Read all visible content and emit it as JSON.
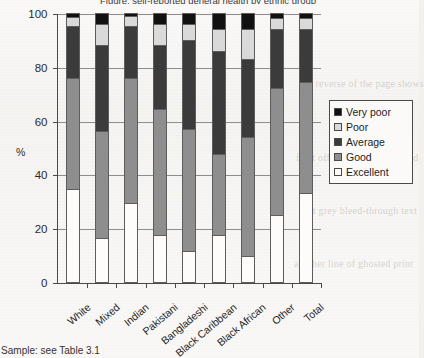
{
  "chart_data": {
    "type": "bar",
    "subtype": "stacked-100-percent",
    "title": "Figure: self-reported general health by ethnic group",
    "xlabel": "",
    "ylabel": "%",
    "ylim": [
      0,
      100
    ],
    "yticks": [
      0,
      20,
      40,
      60,
      80,
      100
    ],
    "grid": true,
    "legend_position": "right",
    "categories": [
      "White",
      "Mixed",
      "Indian",
      "Pakistani",
      "Bangladeshi",
      "Black Caribbean",
      "Black African",
      "Other",
      "Total"
    ],
    "series": [
      {
        "name": "Excellent",
        "color": "#fdfcfa",
        "values": [
          34.5,
          16.5,
          29.5,
          17.5,
          11.5,
          17.5,
          9.5,
          25.0,
          33.0
        ]
      },
      {
        "name": "Good",
        "color": "#8e8e8e",
        "values": [
          41.5,
          39.5,
          46.5,
          47.0,
          45.5,
          30.0,
          44.5,
          47.0,
          41.5
        ]
      },
      {
        "name": "Average",
        "color": "#3b3b3b",
        "values": [
          19.0,
          32.0,
          19.0,
          23.5,
          33.0,
          38.5,
          29.0,
          22.0,
          19.5
        ]
      },
      {
        "name": "Poor",
        "color": "#d9d9d9",
        "values": [
          3.5,
          8.0,
          4.0,
          8.0,
          6.0,
          8.0,
          11.0,
          4.0,
          4.0
        ]
      },
      {
        "name": "Very poor",
        "color": "#111111",
        "values": [
          1.5,
          4.0,
          1.0,
          4.0,
          4.0,
          6.0,
          6.0,
          2.0,
          2.0
        ]
      }
    ],
    "stack_order_bottom_to_top": [
      "Excellent",
      "Good",
      "Average",
      "Poor",
      "Very poor"
    ],
    "cumulative_tops": {
      "White": [
        34.5,
        76.0,
        95.0,
        98.5,
        100
      ],
      "Mixed": [
        16.5,
        56.0,
        88.0,
        96.0,
        100
      ],
      "Indian": [
        29.5,
        76.0,
        95.0,
        99.0,
        100
      ],
      "Pakistani": [
        17.5,
        64.5,
        88.0,
        96.0,
        100
      ],
      "Bangladeshi": [
        11.5,
        57.0,
        90.0,
        96.0,
        100
      ],
      "Black Caribbean": [
        17.5,
        47.5,
        86.0,
        94.0,
        100
      ],
      "Black African": [
        9.5,
        54.0,
        83.0,
        94.0,
        100
      ],
      "Other": [
        25.0,
        72.0,
        94.0,
        98.0,
        100
      ],
      "Total": [
        33.0,
        74.5,
        94.0,
        98.0,
        100
      ]
    }
  },
  "legend": {
    "items": [
      {
        "label": "Very poor",
        "color": "#111111"
      },
      {
        "label": "Poor",
        "color": "#d9d9d9"
      },
      {
        "label": "Average",
        "color": "#3b3b3b"
      },
      {
        "label": "Good",
        "color": "#8e8e8e"
      },
      {
        "label": "Excellent",
        "color": "#fdfcfa"
      }
    ]
  },
  "caption": {
    "text": "e: Sample: see Table 3.1"
  },
  "ghost_text": {
    "lines": [
      "the reverse of the page shows",
      "faint offset print from behind",
      "soft grey bleed-through text",
      "another line of ghosted print"
    ]
  }
}
